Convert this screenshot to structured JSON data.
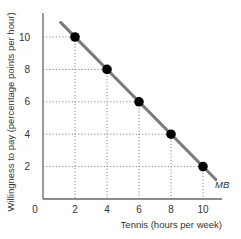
{
  "chart_data": {
    "type": "line",
    "title": "",
    "xlabel": "Tennis (hours per week)",
    "ylabel": "Willingness to pay (percentage points per hour)",
    "xlim": [
      0,
      11.5
    ],
    "ylim": [
      0,
      11.5
    ],
    "x_ticks": [
      0,
      2,
      4,
      6,
      8,
      10
    ],
    "y_ticks": [
      2,
      4,
      6,
      8,
      10
    ],
    "grid": "dotted guide lines from points to axes",
    "series": [
      {
        "name": "MB",
        "label": "MB",
        "color": "#7a7a7a",
        "line_from": [
          1,
          11
        ],
        "line_to": [
          11,
          1
        ],
        "points": [
          {
            "x": 2,
            "y": 10
          },
          {
            "x": 4,
            "y": 8
          },
          {
            "x": 6,
            "y": 6
          },
          {
            "x": 8,
            "y": 4
          },
          {
            "x": 10,
            "y": 2
          }
        ]
      }
    ],
    "point_color": "#000000",
    "curve_label": "MB"
  }
}
